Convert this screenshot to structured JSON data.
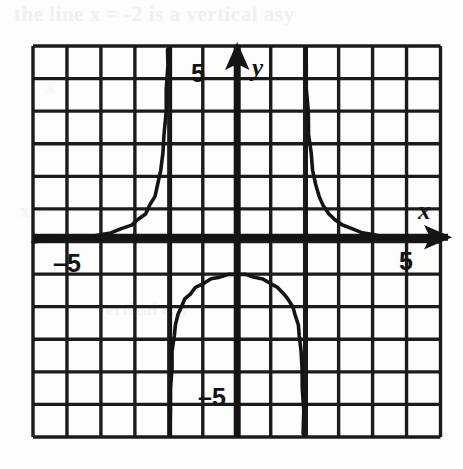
{
  "page": {
    "kind": "scanned-textbook-graph",
    "background_color": "#fdfdfc",
    "ink_color": "#141414"
  },
  "bleed_through_text": {
    "line1": "the line x = -2 is a vertical asy",
    "line2": "x",
    "line3": "x =",
    "line4": "vertical asy"
  },
  "axis_labels": {
    "x_letter": "x",
    "y_letter": "y",
    "x_positive_tick": "5",
    "x_negative_tick": "–5",
    "y_positive_tick": "5",
    "y_negative_tick": "–5"
  },
  "chart_data": {
    "type": "line",
    "title": "",
    "subtitle": "",
    "xlabel": "x",
    "ylabel": "y",
    "xlim": [
      -6,
      6
    ],
    "ylim": [
      -6,
      6
    ],
    "grid": true,
    "grid_step": 1,
    "legend": "none",
    "axis_ticks_labeled": {
      "x": [
        -5,
        5
      ],
      "y": [
        -5,
        5
      ]
    },
    "asymptotes": {
      "vertical": [
        -2,
        2
      ],
      "horizontal": [
        0
      ]
    },
    "series": [
      {
        "name": "left-branch",
        "note": "x < -2, rises from the horizontal asymptote y=0 up to +infinity as x approaches -2 from the left",
        "points": [
          [
            -6.0,
            0.0
          ],
          [
            -5.6,
            0.02
          ],
          [
            -5.2,
            0.05
          ],
          [
            -4.8,
            0.09
          ],
          [
            -4.4,
            0.14
          ],
          [
            -4.0,
            0.2
          ],
          [
            -3.7,
            0.28
          ],
          [
            -3.4,
            0.38
          ],
          [
            -3.1,
            0.52
          ],
          [
            -2.9,
            0.66
          ],
          [
            -2.7,
            0.86
          ],
          [
            -2.55,
            1.1
          ],
          [
            -2.42,
            1.4
          ],
          [
            -2.32,
            1.75
          ],
          [
            -2.24,
            2.2
          ],
          [
            -2.18,
            2.7
          ],
          [
            -2.13,
            3.3
          ],
          [
            -2.09,
            4.0
          ],
          [
            -2.06,
            4.7
          ],
          [
            -2.04,
            5.4
          ],
          [
            -2.03,
            5.9
          ]
        ]
      },
      {
        "name": "middle-branch",
        "note": "-2 < x < 2, an inverted dome with maximum near (0, -1), falling to -infinity at both asymptotes",
        "points": [
          [
            -1.97,
            -5.9
          ],
          [
            -1.96,
            -5.2
          ],
          [
            -1.94,
            -4.5
          ],
          [
            -1.92,
            -3.9
          ],
          [
            -1.89,
            -3.35
          ],
          [
            -1.85,
            -2.9
          ],
          [
            -1.8,
            -2.55
          ],
          [
            -1.73,
            -2.25
          ],
          [
            -1.64,
            -2.0
          ],
          [
            -1.52,
            -1.78
          ],
          [
            -1.38,
            -1.6
          ],
          [
            -1.2,
            -1.42
          ],
          [
            -1.0,
            -1.28
          ],
          [
            -0.75,
            -1.16
          ],
          [
            -0.5,
            -1.08
          ],
          [
            -0.25,
            -1.02
          ],
          [
            0.0,
            -1.0
          ],
          [
            0.25,
            -1.02
          ],
          [
            0.5,
            -1.08
          ],
          [
            0.75,
            -1.16
          ],
          [
            1.0,
            -1.28
          ],
          [
            1.2,
            -1.42
          ],
          [
            1.38,
            -1.6
          ],
          [
            1.52,
            -1.78
          ],
          [
            1.64,
            -2.0
          ],
          [
            1.73,
            -2.25
          ],
          [
            1.8,
            -2.55
          ],
          [
            1.85,
            -2.9
          ],
          [
            1.89,
            -3.35
          ],
          [
            1.92,
            -3.9
          ],
          [
            1.94,
            -4.5
          ],
          [
            1.96,
            -5.2
          ],
          [
            1.97,
            -5.9
          ]
        ]
      },
      {
        "name": "right-branch",
        "note": "x > 2, falls from +infinity near x=2 toward the horizontal asymptote y=0",
        "points": [
          [
            2.03,
            5.9
          ],
          [
            2.04,
            5.4
          ],
          [
            2.06,
            4.7
          ],
          [
            2.09,
            4.0
          ],
          [
            2.13,
            3.3
          ],
          [
            2.18,
            2.7
          ],
          [
            2.24,
            2.2
          ],
          [
            2.32,
            1.75
          ],
          [
            2.42,
            1.4
          ],
          [
            2.55,
            1.1
          ],
          [
            2.7,
            0.86
          ],
          [
            2.9,
            0.66
          ],
          [
            3.1,
            0.52
          ],
          [
            3.4,
            0.38
          ],
          [
            3.7,
            0.28
          ],
          [
            4.0,
            0.2
          ],
          [
            4.4,
            0.14
          ],
          [
            4.8,
            0.09
          ],
          [
            5.2,
            0.05
          ],
          [
            5.6,
            0.02
          ],
          [
            6.0,
            0.0
          ]
        ]
      }
    ]
  }
}
